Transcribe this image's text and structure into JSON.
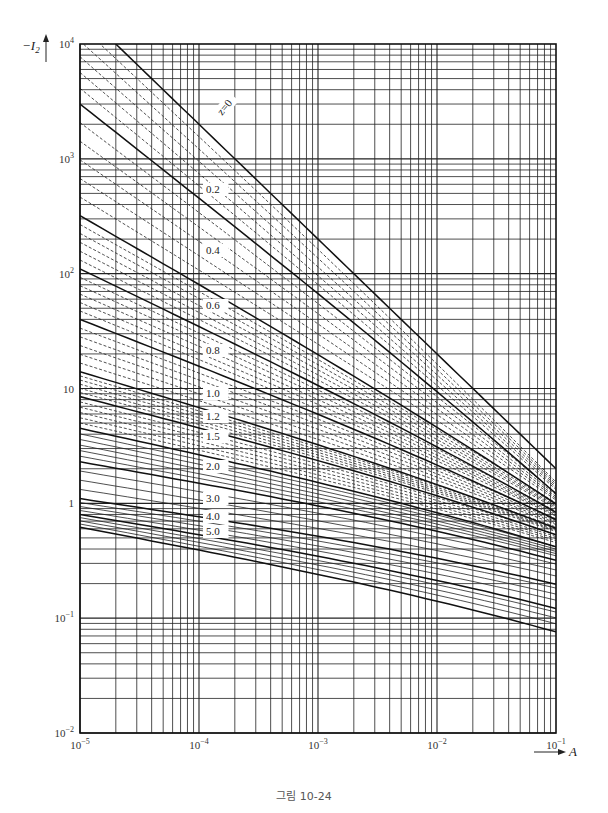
{
  "figure": {
    "caption": "그림 10-24"
  },
  "chart_data": {
    "type": "line",
    "title": "",
    "xlabel": "A",
    "ylabel": "-I2",
    "xscale": "log",
    "yscale": "log",
    "xlim": [
      1e-05,
      0.1
    ],
    "ylim": [
      0.01,
      10000
    ],
    "grid": true,
    "legend": "inline curve labels (z values)",
    "x_tick_labels": [
      "10^-5",
      "10^-4",
      "10^-3",
      "10^-2",
      "10^-1"
    ],
    "x_tick_display": [
      {
        "base": "10",
        "exp": "−5"
      },
      {
        "base": "10",
        "exp": "−4"
      },
      {
        "base": "10",
        "exp": "−3"
      },
      {
        "base": "10",
        "exp": "−2"
      },
      {
        "base": "10",
        "exp": "−1"
      }
    ],
    "y_tick_labels": [
      "10^4",
      "10^3",
      "10^2",
      "10",
      "1",
      "10^-1",
      "10^-2"
    ],
    "y_tick_display": [
      {
        "base": "10",
        "exp": "4"
      },
      {
        "base": "10",
        "exp": "3"
      },
      {
        "base": "10",
        "exp": "2"
      },
      {
        "base": "10",
        "exp": ""
      },
      {
        "base": "1",
        "exp": ""
      },
      {
        "base": "10",
        "exp": "−1"
      },
      {
        "base": "10",
        "exp": "−2"
      }
    ],
    "x": [
      1e-05,
      0.1
    ],
    "series": [
      {
        "name": "z=0",
        "label": "z=0",
        "x_start": 2e-05,
        "values": [
          10000,
          2.0
        ]
      },
      {
        "name": "z=0.2",
        "label": "0.2",
        "values": [
          3000,
          1.6
        ]
      },
      {
        "name": "z=0.4",
        "label": "0.4",
        "values": [
          320,
          1.3
        ]
      },
      {
        "name": "z=0.6",
        "label": "0.6",
        "values": [
          110,
          1.1
        ]
      },
      {
        "name": "z=0.8",
        "label": "0.8",
        "values": [
          40,
          0.95
        ]
      },
      {
        "name": "z=1.0",
        "label": "1.0",
        "values": [
          14,
          0.8
        ]
      },
      {
        "name": "z=1.2",
        "label": "1.2",
        "values": [
          8.5,
          0.7
        ]
      },
      {
        "name": "z=1.5",
        "label": "1.5",
        "values": [
          4.5,
          0.55
        ]
      },
      {
        "name": "z=2.0",
        "label": "2.0",
        "values": [
          2.3,
          0.42
        ]
      },
      {
        "name": "z=3.0",
        "label": "3.0",
        "values": [
          1.1,
          0.26
        ]
      },
      {
        "name": "z=4.0",
        "label": "4.0",
        "values": [
          0.8,
          0.16
        ]
      },
      {
        "name": "z=5.0",
        "label": "5.0",
        "values": [
          0.62,
          0.1
        ]
      }
    ]
  },
  "colors": {
    "ink": "#1a1a1a",
    "grid": "#2a2a2a",
    "background": "#ffffff"
  }
}
